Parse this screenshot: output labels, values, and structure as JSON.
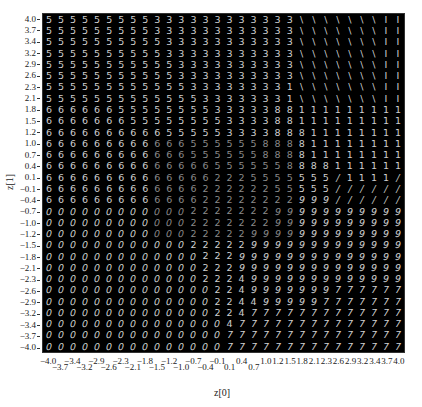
{
  "chart_data": {
    "type": "heatmap",
    "title": "",
    "xlabel": "z[0]",
    "ylabel": "z[1]",
    "xlim": [
      -4.0,
      4.0
    ],
    "ylim": [
      -4.0,
      4.0
    ],
    "grid": false,
    "legend": null,
    "grid_size": 30,
    "x_ticks": [
      "-4.0",
      "-3.7",
      "-3.4",
      "-3.2",
      "-2.9",
      "-2.6",
      "-2.3",
      "-2.1",
      "-1.8",
      "-1.5",
      "-1.2",
      "-1.0",
      "-0.7",
      "-0.4",
      "-0.1",
      "0.1",
      "0.4",
      "0.7",
      "1.0",
      "1.2",
      "1.5",
      "1.8",
      "2.1",
      "2.3",
      "2.6",
      "2.9",
      "3.2",
      "3.4",
      "3.7",
      "4.0"
    ],
    "y_ticks": [
      "4.0",
      "3.7",
      "3.4",
      "3.2",
      "2.9",
      "2.6",
      "2.3",
      "2.1",
      "1.8",
      "1.5",
      "1.2",
      "1.0",
      "0.7",
      "0.4",
      "0.1",
      "-0.1",
      "-0.4",
      "-0.7",
      "-1.0",
      "-1.2",
      "-1.5",
      "-1.8",
      "-2.1",
      "-2.3",
      "-2.6",
      "-2.9",
      "-3.2",
      "-3.4",
      "-3.7",
      "-4.0"
    ],
    "cells": [
      "555555555333333333333\\\\\\\\\\\\\\||",
      "555555555333333333333\\\\\\\\\\\\\\||",
      "555555555533333333333\\\\\\\\\\\\\\||",
      "555555555533333333333\\\\\\\\\\\\\\||",
      "555555555553333333333\\\\\\\\\\\\\\||",
      "555555555553333333333\\\\\\\\\\\\\\||",
      "555555555555333333331\\\\\\\\\\\\\\||",
      "555555555555533333331\\\\\\\\\\\\\\||",
      "666666555555553333388111111111|",
      "666666655555555333388111111111|",
      "666666666655555333388811111111/",
      "666666666666555555888811111111/",
      "666666666666555555888811111111/",
      "666666666666665555558888111111//",
      "666666666666662225555555/1111//",
      "666666666666622222255555//////",
      "666666666666622222222999//////",
      "000000000000222222299999999999",
      "000000000000222222299999999999",
      "000000000000222229999999999999",
      "000000000000222229999999999999",
      "000000000000022299999999999999",
      "000000000000022299999999999999",
      "000000000000022249999999999999",
      "000000000000002249999999777777",
      "000000000000002244999997777777",
      "000000000000002247777777777777",
      "000000000000000477777777777777",
      "000000000000000777777777777777",
      "000000000000000777777777777777"
    ]
  }
}
